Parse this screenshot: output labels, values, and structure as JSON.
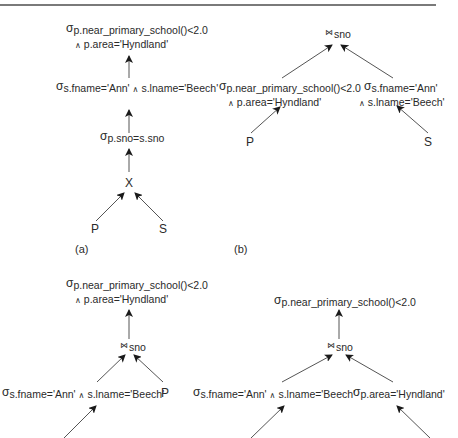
{
  "figure": {
    "top_rule": true,
    "panels": [
      {
        "caption": "(a)",
        "nodes": {
          "root_select": {
            "symbol": "σ",
            "line1": "p.near_primary_school()<2.0",
            "and": "∧",
            "line2": "p.area='Hyndland'"
          },
          "select_s": {
            "symbol": "σ",
            "cond1": "s.fname='Ann'",
            "and": "∧",
            "cond2": "s.lname='Beech'"
          },
          "select_join": {
            "symbol": "σ",
            "cond": "p.sno=s.sno"
          },
          "product": {
            "symbol": "X"
          },
          "leaf_left": "P",
          "leaf_right": "S"
        }
      },
      {
        "caption": "(b)",
        "nodes": {
          "join": {
            "symbol": "⋈",
            "attr": "sno"
          },
          "select_p": {
            "symbol": "σ",
            "line1": "p.near_primary_school()<2.0",
            "and": "∧",
            "line2": "p.area='Hyndland'"
          },
          "select_s": {
            "symbol": "σ",
            "line1": "s.fname='Ann'",
            "and": "∧",
            "line2": "s.lname='Beech'"
          },
          "leaf_left": "P",
          "leaf_right": "S"
        }
      },
      {
        "caption": "",
        "nodes": {
          "root_select": {
            "symbol": "σ",
            "line1": "p.near_primary_school()<2.0",
            "and": "∧",
            "line2": "p.area='Hyndland'"
          },
          "join": {
            "symbol": "⋈",
            "attr": "sno"
          },
          "select_s": {
            "symbol": "σ",
            "cond1": "s.fname='Ann'",
            "and": "∧",
            "cond2": "s.lname='Beech'"
          },
          "leaf_right": "P"
        }
      },
      {
        "caption": "",
        "nodes": {
          "root_select": {
            "symbol": "σ",
            "cond": "p.near_primary_school()<2.0"
          },
          "join": {
            "symbol": "⋈",
            "attr": "sno"
          },
          "select_s": {
            "symbol": "σ",
            "cond1": "s.fname='Ann'",
            "and": "∧",
            "cond2": "s.lname='Beech'"
          },
          "select_p": {
            "symbol": "σ",
            "cond": "p.area='Hyndland'"
          }
        }
      }
    ]
  }
}
